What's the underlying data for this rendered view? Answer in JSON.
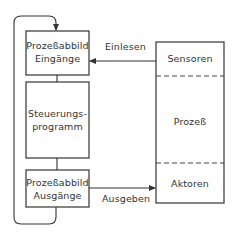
{
  "diagram": {
    "left_column": {
      "input_image": {
        "line1": "Prozeßabbild",
        "line2": "Eingänge"
      },
      "control_program": {
        "line1": "Steuerungs-",
        "line2": "programm"
      },
      "output_image": {
        "line1": "Prozeßabbild",
        "line2": "Ausgänge"
      }
    },
    "process_block": {
      "sensors": "Sensoren",
      "process": "Prozeß",
      "actuators": "Aktoren"
    },
    "arrows": {
      "read_in": "Einlesen",
      "write_out": "Ausgeben"
    },
    "colors": {
      "stroke": "#333333",
      "background": "#ffffff"
    }
  }
}
